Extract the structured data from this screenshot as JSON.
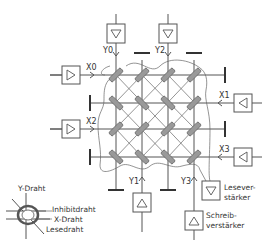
{
  "diagram": {
    "x_lines": [
      {
        "id": "x0",
        "label": "X0",
        "side": "left"
      },
      {
        "id": "x1",
        "label": "X1",
        "side": "right"
      },
      {
        "id": "x2",
        "label": "X2",
        "side": "left"
      },
      {
        "id": "x3",
        "label": "X3",
        "side": "right"
      }
    ],
    "y_lines": [
      {
        "id": "y0",
        "label": "Y0",
        "side": "top"
      },
      {
        "id": "y1",
        "label": "Y1",
        "side": "bottom"
      },
      {
        "id": "y2",
        "label": "Y2",
        "side": "top"
      },
      {
        "id": "y3",
        "label": "Y3",
        "side": "bottom"
      }
    ],
    "amplifiers": {
      "sense_amp_label_line1": "Lesever-",
      "sense_amp_label_line2": "stärker",
      "write_amp_label_line1": "Schreib-",
      "write_amp_label_line2": "verstärker"
    },
    "legend": {
      "y_wire": "Y-Draht",
      "inhibit_wire": "Inhibitdraht",
      "x_wire": "X-Draht",
      "sense_wire": "Lesedraht"
    },
    "core_grid": {
      "rows": 4,
      "cols": 4
    },
    "colors": {
      "line": "#555555",
      "core": "#999999",
      "background": "#ffffff"
    }
  }
}
